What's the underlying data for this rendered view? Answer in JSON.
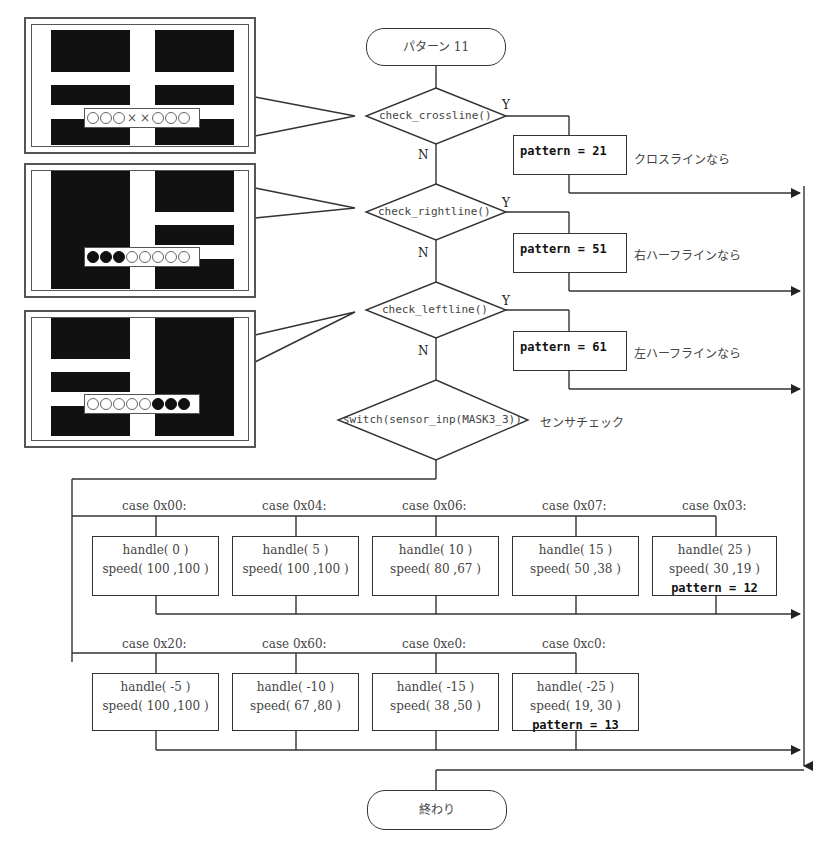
{
  "start_terminal": "パターン 11",
  "end_terminal": "終わり",
  "decisions": [
    {
      "label": "check_crossline()",
      "yes": "Y",
      "no": "N",
      "action": "pattern = 21",
      "comment": "クロスラインなら"
    },
    {
      "label": "check_rightline()",
      "yes": "Y",
      "no": "N",
      "action": "pattern = 51",
      "comment": "右ハーフラインなら"
    },
    {
      "label": "check_leftline()",
      "yes": "Y",
      "no": "N",
      "action": "pattern = 61",
      "comment": "左ハーフラインなら"
    }
  ],
  "switch": {
    "label": "switch(sensor_inp(MASK3_3))",
    "comment": "センサチェック"
  },
  "cases_row1": [
    {
      "case": "case 0x00:",
      "handle": "handle( 0 )",
      "speed": "speed( 100 ,100 )",
      "extra": ""
    },
    {
      "case": "case 0x04:",
      "handle": "handle( 5 )",
      "speed": "speed( 100 ,100 )",
      "extra": ""
    },
    {
      "case": "case 0x06:",
      "handle": "handle( 10 )",
      "speed": "speed( 80 ,67 )",
      "extra": ""
    },
    {
      "case": "case 0x07:",
      "handle": "handle( 15 )",
      "speed": "speed( 50 ,38 )",
      "extra": ""
    },
    {
      "case": "case 0x03:",
      "handle": "handle( 25 )",
      "speed": "speed( 30 ,19 )",
      "extra": "pattern = 12"
    }
  ],
  "cases_row2": [
    {
      "case": "case 0x20:",
      "handle": "handle( -5 )",
      "speed": "speed( 100 ,100 )",
      "extra": ""
    },
    {
      "case": "case 0x60:",
      "handle": "handle( -10 )",
      "speed": "speed( 67 ,80 )",
      "extra": ""
    },
    {
      "case": "case 0xe0:",
      "handle": "handle( -15 )",
      "speed": "speed( 38 ,50 )",
      "extra": ""
    },
    {
      "case": "case 0xc0:",
      "handle": "handle( -25 )",
      "speed": "speed( 19, 30 )",
      "extra": "pattern = 13"
    }
  ],
  "sensor_panels": [
    {
      "name": "crossline",
      "sensors": [
        "o",
        "o",
        "o",
        "x",
        "x",
        "o",
        "o",
        "o"
      ]
    },
    {
      "name": "rightline",
      "sensors": [
        "on",
        "on",
        "on",
        "o",
        "o",
        "o",
        "o",
        "o"
      ]
    },
    {
      "name": "leftline",
      "sensors": [
        "o",
        "o",
        "o",
        "o",
        "o",
        "on",
        "on",
        "on"
      ]
    }
  ]
}
